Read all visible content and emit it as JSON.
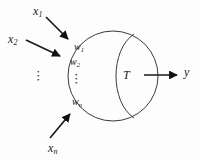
{
  "figure": {
    "background_color": "#fdfdfd",
    "stroke_color": "#3a3a3a",
    "text_color": "#1a1a1a"
  },
  "inputs": [
    {
      "base": "x",
      "sub": "1",
      "x": 33,
      "y": 5
    },
    {
      "base": "x",
      "sub": "2",
      "x": 8,
      "y": 33
    },
    {
      "base": "x",
      "sub": "n",
      "x": 48,
      "y": 142
    }
  ],
  "input_ellipsis": {
    "glyph": "⋮",
    "x": 37,
    "y": 78
  },
  "weights": [
    {
      "base": "w",
      "sub": "1",
      "x": 74,
      "y": 42
    },
    {
      "base": "w",
      "sub": "2",
      "x": 70,
      "y": 57
    },
    {
      "base": "w",
      "sub": "n",
      "x": 72,
      "y": 97
    }
  ],
  "weight_ellipsis": {
    "glyph": "⋮",
    "x": 73,
    "y": 72
  },
  "threshold": {
    "label": "T",
    "x": 123,
    "y": 70
  },
  "output": {
    "base": "y",
    "sub": "",
    "x": 184,
    "y": 65
  },
  "arrows": [
    {
      "name": "input-arrow-1",
      "from_x": 46,
      "from_y": 17,
      "to_x": 70,
      "to_y": 41
    },
    {
      "name": "input-arrow-2",
      "from_x": 26,
      "from_y": 40,
      "to_x": 62,
      "to_y": 57
    },
    {
      "name": "input-arrow-n",
      "from_x": 50,
      "from_y": 138,
      "to_x": 70,
      "to_y": 113
    },
    {
      "name": "output-arrow",
      "from_x": 145,
      "from_y": 75,
      "to_x": 179,
      "to_y": 75
    }
  ],
  "body": {
    "circle": {
      "cx": 113,
      "cy": 76,
      "r": 45
    },
    "lens_arc": {
      "top_x": 134,
      "top_y": 34,
      "bottom_x": 134,
      "bottom_y": 118,
      "bulge_x": 113
    }
  }
}
